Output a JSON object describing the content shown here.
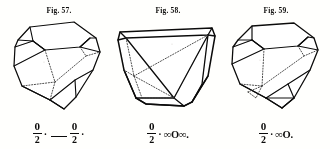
{
  "page": {
    "background_color": "#fbfaf7",
    "ink_color": "#111111",
    "plate_kind": "crystal-figure-plate"
  },
  "figures": [
    {
      "caption": "Fig. 57.",
      "crystal_name": "crystal-figure-57",
      "formula": {
        "terms": [
          {
            "kind": "fraction",
            "numerator": "0",
            "denominator": "2"
          },
          {
            "kind": "dot",
            "text": "·"
          },
          {
            "kind": "rule"
          },
          {
            "kind": "fraction",
            "numerator": "0",
            "denominator": "2"
          },
          {
            "kind": "dot",
            "text": "·"
          }
        ],
        "plain_text": "0/2 · — 0/2 ·"
      }
    },
    {
      "caption": "Fig. 58.",
      "crystal_name": "crystal-figure-58",
      "formula": {
        "terms": [
          {
            "kind": "fraction",
            "numerator": "0",
            "denominator": "2"
          },
          {
            "kind": "dot",
            "text": "·"
          },
          {
            "kind": "symbol",
            "text": "∞O∞."
          }
        ],
        "plain_text": "0/2 · ∞O∞."
      }
    },
    {
      "caption": "Fig. 59.",
      "crystal_name": "crystal-figure-59",
      "formula": {
        "terms": [
          {
            "kind": "fraction",
            "numerator": "0",
            "denominator": "2"
          },
          {
            "kind": "dot",
            "text": "·"
          },
          {
            "kind": "symbol",
            "text": "∞O."
          }
        ],
        "plain_text": "0/2 · ∞O."
      }
    }
  ]
}
